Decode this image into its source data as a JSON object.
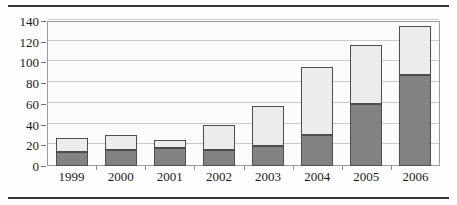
{
  "chart_data": {
    "type": "bar",
    "title": "",
    "subtitle": "",
    "xlabel": "",
    "ylabel": "",
    "stacked": true,
    "grid": true,
    "legend": "none",
    "ylim": [
      0,
      140
    ],
    "yticks": [
      0,
      20,
      40,
      60,
      80,
      100,
      120,
      140
    ],
    "ytick_labels": [
      "0",
      "20",
      "40",
      "60",
      "80",
      "100",
      "120",
      "140"
    ],
    "categories": [
      "1999",
      "2000",
      "2001",
      "2002",
      "2003",
      "2004",
      "2005",
      "2006"
    ],
    "series": [
      {
        "name": "lower-segment",
        "color": "#828282",
        "values": [
          14,
          15,
          17,
          15,
          19,
          30,
          60,
          88
        ]
      },
      {
        "name": "upper-segment",
        "color": "#ececec",
        "values": [
          13,
          15,
          8,
          25,
          39,
          66,
          57,
          47
        ]
      }
    ],
    "totals": [
      27,
      30,
      25,
      40,
      58,
      96,
      117,
      135
    ]
  },
  "figure": {
    "top_rule_color": "#3a3a3a",
    "bottom_rule_color": "#3a3a3a",
    "plot_border_color": "#9a9a9a",
    "gridline_color": "#c9c9c9",
    "background": "#fdfdfd"
  }
}
